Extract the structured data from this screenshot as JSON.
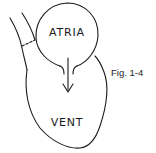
{
  "figure": {
    "caption": "Fig. 1-4",
    "labels": {
      "atria": "ATRIA",
      "ventricle": "VENT"
    },
    "colors": {
      "line": "#1a1a1a",
      "background": "#ffffff"
    }
  }
}
